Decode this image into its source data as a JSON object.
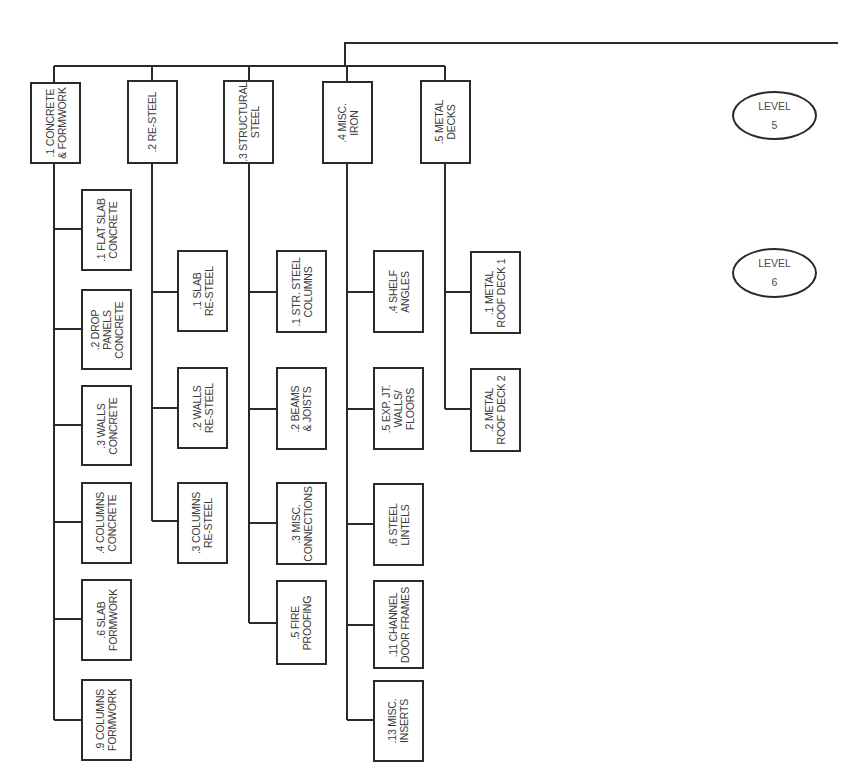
{
  "diagram": {
    "type": "work-breakdown-structure",
    "line_color": "#2a2a2a",
    "text_color": "#3a3a3a",
    "levels": [
      {
        "label": "LEVEL",
        "number": "5"
      },
      {
        "label": "LEVEL",
        "number": "6"
      }
    ],
    "branches": [
      {
        "label": ".1 CONCRETE\n& FORMWORK",
        "children": [
          ".1 FLAT SLAB\nCONCRETE",
          ".2 DROP\nPANELS\nCONCRETE",
          ".3 WALLS\nCONCRETE",
          ".4 COLUMNS\nCONCRETE",
          ".6 SLAB\nFORMWORK",
          ".9 COLUMNS\nFORMWORK"
        ]
      },
      {
        "label": ".2 RE-STEEL",
        "children": [
          ".1 SLAB\nRE-STEEL",
          ".2 WALLS\nRE-STEEL",
          ".3 COLUMNS\nRE-STEEL"
        ]
      },
      {
        "label": ".3 STRUCTURAL\nSTEEL",
        "children": [
          ".1 STR. STEEL\nCOLUMNS",
          ".2 BEAMS\n& JOISTS",
          ".3 MISC.\nCONNECTIONS",
          ".5 FIRE\nPROOFING"
        ]
      },
      {
        "label": ".4 MISC.\nIRON",
        "children": [
          ".4 SHELF\nANGLES",
          ".5 EXP. JT.\nWALLS/\nFLOORS",
          ".6 STEEL\nLINTELS",
          ".11 CHANNEL\nDOOR FRAMES",
          ".13 MISC.\nINSERTS"
        ]
      },
      {
        "label": ".5 METAL\nDECKS",
        "children": [
          ".1 METAL\nROOF DECK 1",
          ".2 METAL\nROOF DECK 2"
        ]
      }
    ]
  }
}
